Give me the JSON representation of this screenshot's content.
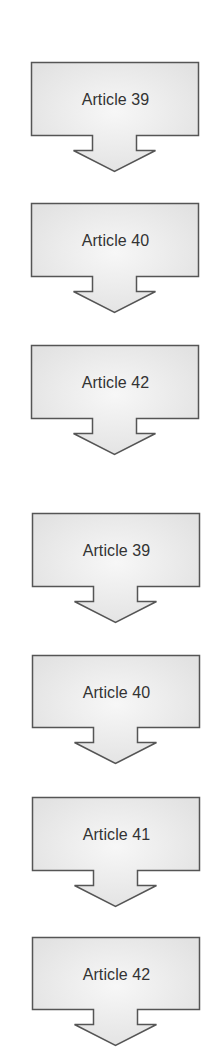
{
  "diagram": {
    "type": "vertical-flow-arrows",
    "colors": {
      "fill_edge": "#e2e2e2",
      "fill_center": "#f7f7f7",
      "stroke": "#555555",
      "text": "#333333",
      "background": "#ffffff"
    },
    "sequences": [
      {
        "name": "sequence-1",
        "steps": [
          {
            "label": "Article 39",
            "x": 31,
            "y": 62
          },
          {
            "label": "Article 40",
            "x": 31,
            "y": 203
          },
          {
            "label": "Article 42",
            "x": 31,
            "y": 345
          }
        ]
      },
      {
        "name": "sequence-2",
        "steps": [
          {
            "label": "Article 39",
            "x": 32,
            "y": 513
          },
          {
            "label": "Article 40",
            "x": 32,
            "y": 655
          },
          {
            "label": "Article 41",
            "x": 32,
            "y": 797
          },
          {
            "label": "Article 42",
            "x": 32,
            "y": 937
          }
        ]
      }
    ]
  }
}
